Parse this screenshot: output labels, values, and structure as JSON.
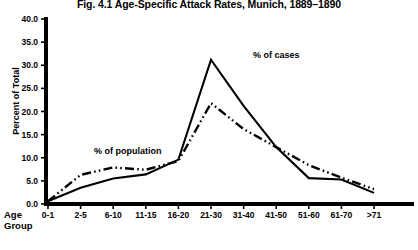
{
  "figure": {
    "title": "Fig. 4.1  Age-Specific Attack Rates, Munich, 1889–1890",
    "x_axis_title_line1": "Age",
    "x_axis_title_line2": "Group",
    "y_axis_title": "Percent of Total",
    "annotation_cases": "% of cases",
    "annotation_population": "% of population"
  },
  "chart_data": {
    "type": "line",
    "title": "Fig. 4.1  Age-Specific Attack Rates, Munich, 1889–1890",
    "xlabel": "Age Group",
    "ylabel": "Percent of Total",
    "categories": [
      "0-1",
      "2-5",
      "6-10",
      "11-15",
      "16-20",
      "21-30",
      "31-40",
      "41-50",
      "51-60",
      "61-70",
      ">71"
    ],
    "ylim": [
      0.0,
      40.0
    ],
    "ytick_labels": [
      "40.0",
      "35.0",
      "30.0",
      "25.0",
      "20.0",
      "15.0",
      "10.0",
      "5.0",
      "0.0"
    ],
    "ytick_values": [
      40.0,
      35.0,
      30.0,
      25.0,
      20.0,
      15.0,
      10.0,
      5.0,
      0.0
    ],
    "grid": false,
    "legend": "inline-annotations",
    "series": [
      {
        "name": "% of cases",
        "style": "solid",
        "values": [
          0.6,
          3.5,
          5.5,
          6.4,
          9.6,
          31.2,
          21.2,
          12.3,
          5.6,
          5.3,
          2.4
        ]
      },
      {
        "name": "% of population",
        "style": "dash-dot-dot",
        "values": [
          0.6,
          6.3,
          7.9,
          7.4,
          9.3,
          21.8,
          16.2,
          12.3,
          8.4,
          5.7,
          3.2
        ]
      }
    ]
  }
}
